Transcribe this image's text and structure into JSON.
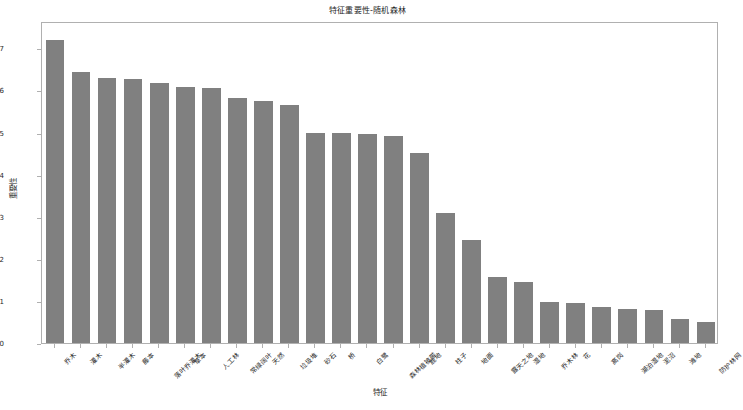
{
  "chart_data": {
    "type": "bar",
    "title": "特征重要性-随机森林",
    "xlabel": "特征",
    "ylabel": "重要性",
    "grid": false,
    "legend": null,
    "bar_color": "#808080",
    "ylim": [
      0.0,
      0.0765
    ],
    "ytick_labels": [
      "0.00",
      "0.01",
      "0.02",
      "0.03",
      "0.04",
      "0.05",
      "0.06",
      "0.07"
    ],
    "ytick_values": [
      0.0,
      0.01,
      0.02,
      0.03,
      0.04,
      0.05,
      0.06,
      0.07
    ],
    "categories": [
      "乔木",
      "灌木",
      "半灌木",
      "藤本",
      "落叶乔灌木",
      "草本",
      "人工林",
      "常绿阔叶",
      "天然",
      "垃圾堆",
      "砂石",
      "桥",
      "白鹭",
      "森林植被带",
      "鹿地",
      "柱子",
      "地面",
      "露天之地",
      "湿地",
      "乔木林",
      "花",
      "高岗",
      "湖泊湿地",
      "泥沼",
      "滩地",
      "防护林网"
    ],
    "values": [
      0.072,
      0.0643,
      0.0629,
      0.0628,
      0.0618,
      0.0609,
      0.0606,
      0.0583,
      0.0575,
      0.0565,
      0.05,
      0.0498,
      0.0496,
      0.0493,
      0.0452,
      0.031,
      0.0244,
      0.0157,
      0.0145,
      0.0097,
      0.0094,
      0.0085,
      0.0081,
      0.0078,
      0.0058,
      0.0049
    ]
  }
}
